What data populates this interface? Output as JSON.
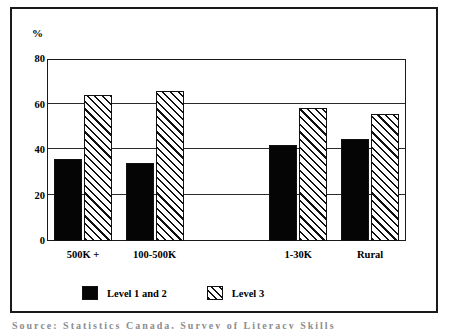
{
  "figure": {
    "y_unit_label": "%",
    "caption_partial": "Source:   Statistics Canada, Survey of Literacy Skills"
  },
  "legend": {
    "position": "bottom-center",
    "entries": [
      {
        "label": "Level 1 and 2",
        "pattern": "solid-black",
        "color": "#050505"
      },
      {
        "label": "Level 3",
        "pattern": "diagonal-hatch",
        "color": "#ffffff"
      }
    ]
  },
  "chart_data": {
    "type": "bar",
    "title": "",
    "subtitle": "",
    "xlabel": "",
    "ylabel": "%",
    "ylim": [
      0,
      80
    ],
    "yticks": [
      0,
      20,
      40,
      60,
      80
    ],
    "ytick_labels": [
      "0",
      "20",
      "40",
      "60",
      "80"
    ],
    "grid": true,
    "grid_axis": "y",
    "categories": [
      "500K +",
      "100-500K",
      "",
      "1-30K",
      "Rural"
    ],
    "series": [
      {
        "name": "Level 1 and 2",
        "values": [
          36,
          34.5,
          null,
          42,
          45
        ]
      },
      {
        "name": "Level 3",
        "values": [
          64,
          66,
          null,
          58.5,
          56
        ]
      }
    ]
  }
}
